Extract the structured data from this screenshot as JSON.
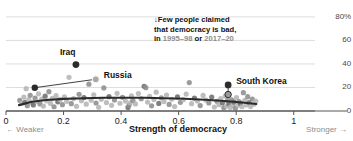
{
  "chart_data": {
    "type": "scatter",
    "title": "",
    "xlabel": "Strength of democracy",
    "ylabel": "",
    "xlim": [
      0,
      1.06
    ],
    "ylim": [
      0,
      85
    ],
    "grid": true,
    "legend_position": "none",
    "x_ticks": [
      "0",
      "0.2",
      "0.4",
      "0.6",
      "0.8",
      "1"
    ],
    "x_tick_values": [
      0,
      0.2,
      0.4,
      0.6,
      0.8,
      1
    ],
    "y_ticks": [
      "0",
      "20",
      "40",
      "60",
      "80%"
    ],
    "y_tick_values": [
      0,
      20,
      40,
      60,
      80
    ],
    "x_axis_left_note": "← Weaker",
    "x_axis_right_note": "Stronger →",
    "annotation": {
      "arrow": "↓",
      "line1": "Few people claimed",
      "line2": "that democracy is bad,",
      "line3_prefix": "in ",
      "line3_year1": "1995–98",
      "line3_middle": " or ",
      "line3_year2": "2017–20"
    },
    "labeled_points": [
      {
        "name": "Iraq",
        "x": 0.243,
        "y": 39.5,
        "color": "#2b2b2b",
        "marker": "filled",
        "label_dx": -16,
        "label_dy": -13
      },
      {
        "name": "Russia",
        "x": 0.312,
        "y": 27.0,
        "color": "#8d8d8d",
        "marker": "open",
        "label_dx": 8,
        "label_dy": -4
      },
      {
        "name": "South Korea",
        "x": 0.772,
        "y": 22.2,
        "color": "#2b2b2b",
        "marker": "filled",
        "label_dx": 8,
        "label_dy": -4
      }
    ],
    "connectors": [
      {
        "from_x": 0.1,
        "from_y": 19.8,
        "to_x": 0.312,
        "to_y": 27.0
      },
      {
        "from_x": 0.772,
        "from_y": 22.2,
        "to_x": 0.772,
        "to_y": 14.0
      }
    ],
    "extra_dark_points": [
      {
        "x": 0.1,
        "y": 19.8
      },
      {
        "x": 0.772,
        "y": 14.0,
        "marker": "open"
      }
    ],
    "trend_line": {
      "color": "#2b2b2b",
      "x": [
        0.045,
        0.09,
        0.14,
        0.2,
        0.27,
        0.34,
        0.41,
        0.48,
        0.55,
        0.62,
        0.69,
        0.76,
        0.82,
        0.87
      ],
      "y": [
        5.0,
        7.9,
        9.4,
        10.3,
        10.9,
        11.2,
        11.3,
        11.2,
        10.9,
        10.4,
        9.6,
        8.5,
        7.2,
        6.0
      ]
    },
    "scatter_light_color": "#b5b5b5",
    "scatter_mid_color": "#8d8d8d",
    "scatter_dark_color": "#6e6e6e",
    "points": [
      {
        "x": 0.048,
        "y": 9.0,
        "c": "m"
      },
      {
        "x": 0.055,
        "y": 6.6,
        "c": "l"
      },
      {
        "x": 0.062,
        "y": 11.8,
        "c": "l"
      },
      {
        "x": 0.066,
        "y": 7.4,
        "c": "d"
      },
      {
        "x": 0.07,
        "y": 19.0,
        "c": "l"
      },
      {
        "x": 0.074,
        "y": 4.5,
        "c": "m"
      },
      {
        "x": 0.079,
        "y": 9.6,
        "c": "l"
      },
      {
        "x": 0.084,
        "y": 13.4,
        "c": "m"
      },
      {
        "x": 0.09,
        "y": 7.0,
        "c": "l"
      },
      {
        "x": 0.095,
        "y": 5.2,
        "c": "d"
      },
      {
        "x": 0.101,
        "y": 11.0,
        "c": "m"
      },
      {
        "x": 0.107,
        "y": 8.0,
        "c": "l"
      },
      {
        "x": 0.113,
        "y": 14.6,
        "c": "l"
      },
      {
        "x": 0.118,
        "y": 6.0,
        "c": "m"
      },
      {
        "x": 0.124,
        "y": 10.2,
        "c": "l"
      },
      {
        "x": 0.13,
        "y": 4.2,
        "c": "l"
      },
      {
        "x": 0.136,
        "y": 12.6,
        "c": "d"
      },
      {
        "x": 0.142,
        "y": 8.6,
        "c": "l"
      },
      {
        "x": 0.149,
        "y": 16.4,
        "c": "m"
      },
      {
        "x": 0.155,
        "y": 6.4,
        "c": "l"
      },
      {
        "x": 0.161,
        "y": 10.8,
        "c": "l"
      },
      {
        "x": 0.167,
        "y": 3.6,
        "c": "m"
      },
      {
        "x": 0.174,
        "y": 13.0,
        "c": "l"
      },
      {
        "x": 0.18,
        "y": 7.8,
        "c": "d"
      },
      {
        "x": 0.188,
        "y": 9.8,
        "c": "l"
      },
      {
        "x": 0.196,
        "y": 5.4,
        "c": "m"
      },
      {
        "x": 0.203,
        "y": 12.0,
        "c": "l"
      },
      {
        "x": 0.211,
        "y": 8.2,
        "c": "l"
      },
      {
        "x": 0.219,
        "y": 28.6,
        "c": "l"
      },
      {
        "x": 0.227,
        "y": 6.2,
        "c": "m"
      },
      {
        "x": 0.235,
        "y": 10.6,
        "c": "l"
      },
      {
        "x": 0.245,
        "y": 4.0,
        "c": "l"
      },
      {
        "x": 0.254,
        "y": 14.2,
        "c": "m"
      },
      {
        "x": 0.262,
        "y": 8.8,
        "c": "l"
      },
      {
        "x": 0.271,
        "y": 11.4,
        "c": "d"
      },
      {
        "x": 0.279,
        "y": 5.8,
        "c": "l"
      },
      {
        "x": 0.288,
        "y": 22.8,
        "c": "m"
      },
      {
        "x": 0.296,
        "y": 9.2,
        "c": "l"
      },
      {
        "x": 0.305,
        "y": 13.8,
        "c": "l"
      },
      {
        "x": 0.313,
        "y": 6.8,
        "c": "m"
      },
      {
        "x": 0.322,
        "y": 3.2,
        "c": "l"
      },
      {
        "x": 0.331,
        "y": 10.0,
        "c": "l"
      },
      {
        "x": 0.34,
        "y": 19.6,
        "c": "m"
      },
      {
        "x": 0.349,
        "y": 7.2,
        "c": "l"
      },
      {
        "x": 0.358,
        "y": 12.2,
        "c": "d"
      },
      {
        "x": 0.367,
        "y": 4.8,
        "c": "l"
      },
      {
        "x": 0.377,
        "y": 9.4,
        "c": "m"
      },
      {
        "x": 0.386,
        "y": 15.0,
        "c": "l"
      },
      {
        "x": 0.396,
        "y": 6.6,
        "c": "l"
      },
      {
        "x": 0.405,
        "y": 11.6,
        "c": "m"
      },
      {
        "x": 0.415,
        "y": 8.4,
        "c": "l"
      },
      {
        "x": 0.424,
        "y": 3.0,
        "c": "d"
      },
      {
        "x": 0.428,
        "y": 5.0,
        "c": "m"
      },
      {
        "x": 0.432,
        "y": 7.0,
        "c": "l"
      },
      {
        "x": 0.436,
        "y": 12.8,
        "c": "l"
      },
      {
        "x": 0.441,
        "y": 9.0,
        "c": "m"
      },
      {
        "x": 0.45,
        "y": 6.0,
        "c": "l"
      },
      {
        "x": 0.46,
        "y": 14.8,
        "c": "l"
      },
      {
        "x": 0.47,
        "y": 10.4,
        "c": "m"
      },
      {
        "x": 0.48,
        "y": 21.0,
        "c": "d"
      },
      {
        "x": 0.486,
        "y": 19.8,
        "c": "m"
      },
      {
        "x": 0.492,
        "y": 7.6,
        "c": "l"
      },
      {
        "x": 0.499,
        "y": 12.4,
        "c": "l"
      },
      {
        "x": 0.506,
        "y": 4.4,
        "c": "m"
      },
      {
        "x": 0.514,
        "y": 9.8,
        "c": "l"
      },
      {
        "x": 0.522,
        "y": 16.0,
        "c": "l"
      },
      {
        "x": 0.531,
        "y": 6.4,
        "c": "d"
      },
      {
        "x": 0.54,
        "y": 11.2,
        "c": "m"
      },
      {
        "x": 0.549,
        "y": 8.0,
        "c": "l"
      },
      {
        "x": 0.558,
        "y": 13.6,
        "c": "l"
      },
      {
        "x": 0.567,
        "y": 5.6,
        "c": "m"
      },
      {
        "x": 0.576,
        "y": 10.0,
        "c": "l"
      },
      {
        "x": 0.586,
        "y": 3.8,
        "c": "l"
      },
      {
        "x": 0.596,
        "y": 12.0,
        "c": "d"
      },
      {
        "x": 0.606,
        "y": 7.4,
        "c": "m"
      },
      {
        "x": 0.616,
        "y": 9.6,
        "c": "l"
      },
      {
        "x": 0.626,
        "y": 14.4,
        "c": "l"
      },
      {
        "x": 0.637,
        "y": 24.2,
        "c": "m"
      },
      {
        "x": 0.645,
        "y": 6.2,
        "c": "l"
      },
      {
        "x": 0.655,
        "y": 11.0,
        "c": "d"
      },
      {
        "x": 0.665,
        "y": 8.6,
        "c": "l"
      },
      {
        "x": 0.675,
        "y": 4.6,
        "c": "m"
      },
      {
        "x": 0.685,
        "y": 13.2,
        "c": "l"
      },
      {
        "x": 0.695,
        "y": 9.2,
        "c": "l"
      },
      {
        "x": 0.705,
        "y": 6.8,
        "c": "m"
      },
      {
        "x": 0.715,
        "y": 11.8,
        "c": "d"
      },
      {
        "x": 0.724,
        "y": 3.4,
        "c": "l"
      },
      {
        "x": 0.733,
        "y": 8.2,
        "c": "m"
      },
      {
        "x": 0.74,
        "y": 5.4,
        "c": "l"
      },
      {
        "x": 0.746,
        "y": 10.6,
        "c": "l"
      },
      {
        "x": 0.752,
        "y": 7.0,
        "c": "d"
      },
      {
        "x": 0.757,
        "y": 2.8,
        "c": "m"
      },
      {
        "x": 0.762,
        "y": 12.6,
        "c": "l"
      },
      {
        "x": 0.766,
        "y": 4.2,
        "c": "l"
      },
      {
        "x": 0.77,
        "y": 8.8,
        "c": "m"
      },
      {
        "x": 0.775,
        "y": 6.0,
        "c": "d"
      },
      {
        "x": 0.779,
        "y": 3.0,
        "c": "l"
      },
      {
        "x": 0.784,
        "y": 9.4,
        "c": "m"
      },
      {
        "x": 0.788,
        "y": 5.0,
        "c": "l"
      },
      {
        "x": 0.792,
        "y": 7.6,
        "c": "d"
      },
      {
        "x": 0.797,
        "y": 2.4,
        "c": "m"
      },
      {
        "x": 0.801,
        "y": 11.4,
        "c": "l"
      },
      {
        "x": 0.806,
        "y": 4.8,
        "c": "l"
      },
      {
        "x": 0.81,
        "y": 8.0,
        "c": "m"
      },
      {
        "x": 0.815,
        "y": 6.4,
        "c": "d"
      },
      {
        "x": 0.82,
        "y": 3.6,
        "c": "l"
      },
      {
        "x": 0.825,
        "y": 15.6,
        "c": "m"
      },
      {
        "x": 0.83,
        "y": 9.0,
        "c": "l"
      },
      {
        "x": 0.835,
        "y": 5.2,
        "c": "l"
      },
      {
        "x": 0.84,
        "y": 12.2,
        "c": "m"
      },
      {
        "x": 0.845,
        "y": 7.2,
        "c": "d"
      },
      {
        "x": 0.85,
        "y": 3.8,
        "c": "l"
      },
      {
        "x": 0.856,
        "y": 10.2,
        "c": "m"
      },
      {
        "x": 0.862,
        "y": 5.8,
        "c": "l"
      },
      {
        "x": 0.868,
        "y": 8.4,
        "c": "l"
      }
    ]
  }
}
